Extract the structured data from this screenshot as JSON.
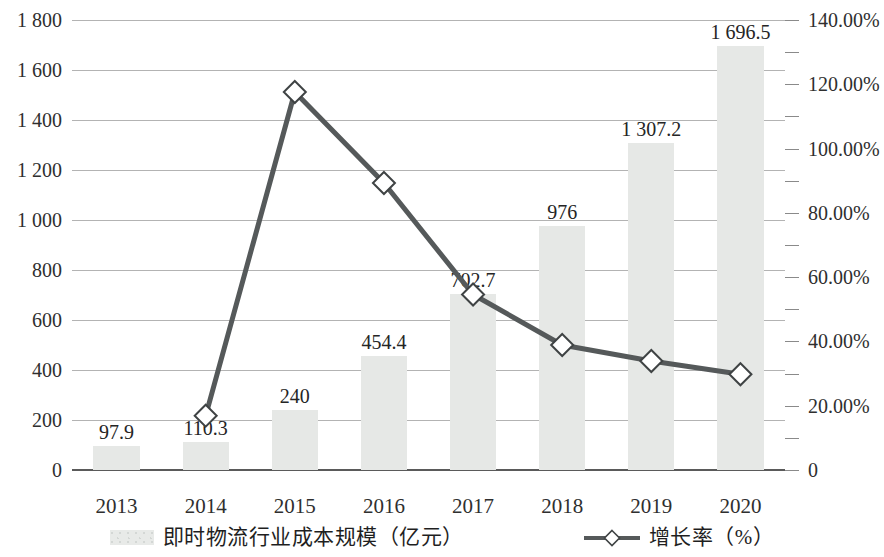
{
  "chart_data": {
    "type": "bar",
    "title": "",
    "subtitle": "",
    "xlabel": "",
    "ylabel": "",
    "y2label": "",
    "categories": [
      "2013",
      "2014",
      "2015",
      "2016",
      "2017",
      "2018",
      "2019",
      "2020"
    ],
    "ylim": [
      0,
      1800
    ],
    "y2lim": [
      0,
      140
    ],
    "grid": true,
    "legend_position": "bottom",
    "y_ticks": [
      "0",
      "200",
      "400",
      "600",
      "800",
      "1 000",
      "1 200",
      "1 400",
      "1 600",
      "1 800"
    ],
    "y_tick_values": [
      0,
      200,
      400,
      600,
      800,
      1000,
      1200,
      1400,
      1600,
      1800
    ],
    "y2_ticks": [
      "0",
      "20.00%",
      "40.00%",
      "60.00%",
      "80.00%",
      "100.00%",
      "120.00%",
      "140.00%"
    ],
    "y2_tick_values": [
      0,
      20,
      40,
      60,
      80,
      100,
      120,
      140
    ],
    "series": [
      {
        "name": "即时物流行业成本规模（亿元）",
        "type": "bar",
        "axis": "left",
        "color": "#e6e8e6",
        "values": [
          97.9,
          110.3,
          240,
          454.4,
          702.7,
          976,
          1307.2,
          1696.5
        ],
        "labels": [
          "97.9",
          "110.3",
          "240",
          "454.4",
          "702.7",
          "976",
          "1 307.2",
          "1 696.5"
        ]
      },
      {
        "name": "增长率（%）",
        "type": "line",
        "axis": "right",
        "color": "#55595a",
        "marker": "diamond",
        "values": [
          null,
          16.9,
          117.6,
          89.3,
          54.6,
          38.9,
          33.9,
          29.8
        ]
      }
    ]
  },
  "legend": {
    "items": [
      {
        "label": "即时物流行业成本规模（亿元）",
        "marker": "bar-swatch-icon"
      },
      {
        "label": "增长率（%）",
        "marker": "line-diamond-icon"
      }
    ]
  },
  "colors": {
    "bar_fill": "#e6e8e6",
    "line_stroke": "#55595a",
    "marker_fill": "#ffffff",
    "gridline": "#9a9a9a",
    "axis": "#5a5a5a",
    "text": "#2f2f2f"
  }
}
